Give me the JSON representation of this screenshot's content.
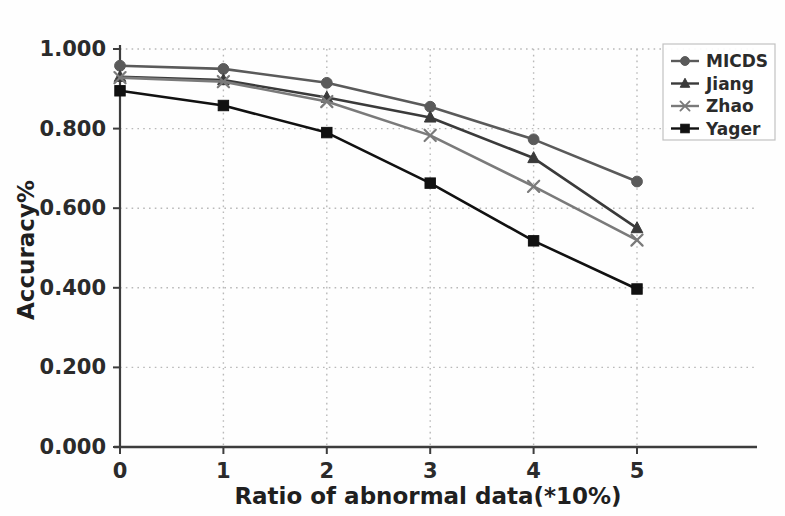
{
  "chart_data": {
    "type": "line",
    "title": "",
    "xlabel": "Ratio of abnormal data(*10%)",
    "ylabel": "Accuracy%",
    "x": [
      0,
      1,
      2,
      3,
      4,
      5
    ],
    "xtick_labels": [
      "0",
      "1",
      "2",
      "3",
      "4",
      "5"
    ],
    "ytick_labels": [
      "0.000",
      "0.200",
      "0.400",
      "0.600",
      "0.800",
      "1.000"
    ],
    "ytick_values": [
      0.0,
      0.2,
      0.4,
      0.6,
      0.8,
      1.0
    ],
    "xlim": [
      -0.12,
      5.45
    ],
    "ylim": [
      0.0,
      1.0
    ],
    "grid": true,
    "grid_style": "dotted",
    "legend_position": "upper right",
    "series": [
      {
        "name": "MICDS",
        "marker": "circle",
        "color": "#5a5a5a",
        "values": [
          0.958,
          0.95,
          0.915,
          0.855,
          0.773,
          0.667
        ]
      },
      {
        "name": "Jiang",
        "marker": "triangle",
        "color": "#3a3a3a",
        "values": [
          0.93,
          0.922,
          0.878,
          0.828,
          0.726,
          0.55
        ]
      },
      {
        "name": "Zhao",
        "marker": "x",
        "color": "#7a7a7a",
        "values": [
          0.928,
          0.918,
          0.868,
          0.783,
          0.655,
          0.52
        ]
      },
      {
        "name": "Yager",
        "marker": "square",
        "color": "#111111",
        "values": [
          0.895,
          0.858,
          0.79,
          0.663,
          0.518,
          0.397
        ]
      }
    ]
  },
  "colors": {
    "background": "#fefefe",
    "axis": "#3d3d3d",
    "grid": "#b9b9b9",
    "text": "#2b2b2b",
    "legend_border": "#c2c2c2"
  }
}
